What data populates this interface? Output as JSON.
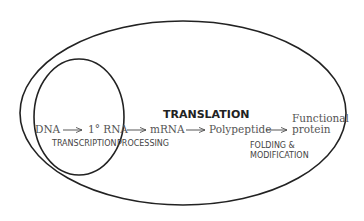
{
  "diagram": {
    "outer_label": "TRANSLATION",
    "nodes": [
      {
        "id": "dna",
        "label": "DNA"
      },
      {
        "id": "rna1",
        "label": "1° RNA"
      },
      {
        "id": "mrna",
        "label": "mRNA"
      },
      {
        "id": "polypeptide",
        "label": "Polypeptide"
      },
      {
        "id": "protein_line1",
        "label": "Functional"
      },
      {
        "id": "protein_line2",
        "label": "protein"
      }
    ],
    "process_labels": {
      "transcription": "TRANSCRIPTION",
      "processing": "PROCESSING",
      "folding_line1": "FOLDING &",
      "folding_line2": "MODIFICATION"
    },
    "edges": [
      {
        "from": "dna",
        "to": "rna1",
        "process": "TRANSCRIPTION"
      },
      {
        "from": "rna1",
        "to": "mrna",
        "process": "PROCESSING"
      },
      {
        "from": "mrna",
        "to": "polypeptide",
        "process": "TRANSLATION"
      },
      {
        "from": "polypeptide",
        "to": "protein",
        "process": "FOLDING & MODIFICATION"
      }
    ],
    "colors": {
      "stroke": "#222222",
      "text": "#555555"
    }
  }
}
